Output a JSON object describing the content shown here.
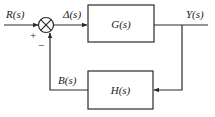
{
  "diagram": {
    "type": "closed-loop feedback control block diagram",
    "signals": {
      "input": "R(s)",
      "error": "Δ(s)",
      "output": "Y(s)",
      "feedback": "B(s)"
    },
    "blocks": {
      "forward": "G(s)",
      "feedback": "H(s)"
    },
    "summing_junction": {
      "plus_sign": "+",
      "minus_sign": "−"
    },
    "colors": {
      "line": "#2a2a2a",
      "background": "#ffffff"
    }
  }
}
